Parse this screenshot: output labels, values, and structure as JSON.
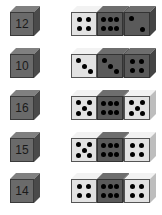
{
  "colors": {
    "light_die": "#e2e2e2",
    "dark_die": "#5a5a5a",
    "label_cube": "#6a6a6a",
    "pip": "#000000"
  },
  "rows": [
    {
      "sum": "12",
      "dice": [
        {
          "shade": "light",
          "pips": 4
        },
        {
          "shade": "dark",
          "pips": 6
        },
        {
          "shade": "dark",
          "pips": 2
        }
      ]
    },
    {
      "sum": "10",
      "dice": [
        {
          "shade": "light",
          "pips": 3
        },
        {
          "shade": "dark",
          "pips": 3
        },
        {
          "shade": "dark",
          "pips": 4
        }
      ]
    },
    {
      "sum": "16",
      "dice": [
        {
          "shade": "light",
          "pips": 5
        },
        {
          "shade": "dark",
          "pips": 6
        },
        {
          "shade": "light",
          "pips": 5
        }
      ]
    },
    {
      "sum": "15",
      "dice": [
        {
          "shade": "light",
          "pips": 5
        },
        {
          "shade": "dark",
          "pips": 6
        },
        {
          "shade": "light",
          "pips": 4
        }
      ]
    },
    {
      "sum": "14",
      "dice": [
        {
          "shade": "light",
          "pips": 4
        },
        {
          "shade": "dark",
          "pips": 6
        },
        {
          "shade": "light",
          "pips": 4
        }
      ]
    }
  ]
}
